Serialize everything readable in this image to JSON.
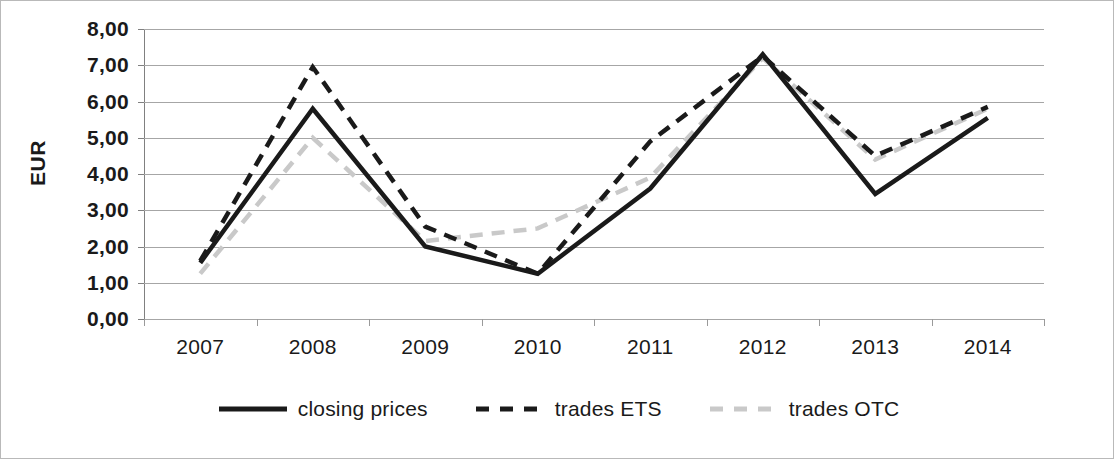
{
  "chart_data": {
    "type": "line",
    "title": "",
    "xlabel": "",
    "ylabel": "EUR",
    "categories": [
      "2007",
      "2008",
      "2009",
      "2010",
      "2011",
      "2012",
      "2013",
      "2014"
    ],
    "ylim": [
      0,
      8
    ],
    "ytick_labels": [
      "8,00",
      "7,00",
      "6,00",
      "5,00",
      "4,00",
      "3,00",
      "2,00",
      "1,00",
      "0,00"
    ],
    "ytick_values": [
      8,
      7,
      6,
      5,
      4,
      3,
      2,
      1,
      0
    ],
    "grid": true,
    "legend_position": "bottom",
    "series": [
      {
        "name": "closing prices",
        "style": "solid",
        "color": "#1a1a1a",
        "values": [
          1.55,
          5.8,
          2.0,
          1.25,
          3.6,
          7.3,
          3.45,
          5.55
        ]
      },
      {
        "name": "trades ETS",
        "style": "dashed",
        "color": "#1a1a1a",
        "values": [
          1.6,
          6.95,
          2.55,
          1.25,
          4.9,
          7.25,
          4.5,
          5.85
        ]
      },
      {
        "name": "trades OTC",
        "style": "dashed",
        "color": "#c9c9c9",
        "values": [
          1.25,
          5.0,
          2.15,
          2.5,
          3.9,
          7.2,
          4.4,
          5.8
        ]
      }
    ]
  },
  "axis": {
    "y_title": "EUR"
  },
  "legend": {
    "items": [
      {
        "label": "closing prices",
        "icon": "solid-line-swatch"
      },
      {
        "label": "trades ETS",
        "icon": "dashed-line-swatch"
      },
      {
        "label": "trades OTC",
        "icon": "dashed-light-line-swatch"
      }
    ]
  }
}
